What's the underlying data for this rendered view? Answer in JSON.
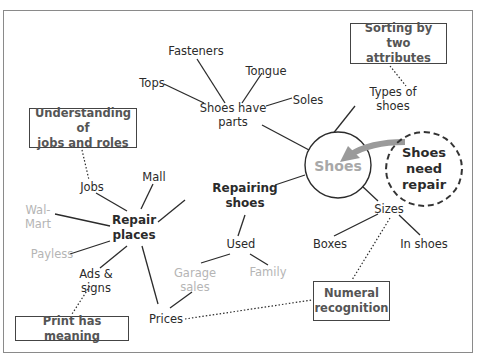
{
  "diagram": {
    "central_topic": "Shoes",
    "trigger": "Shoes\nneed\nrepair",
    "nodes": {
      "fasteners": "Fasteners",
      "tops": "Tops",
      "tongue": "Tongue",
      "soles": "Soles",
      "shoes_have_parts": "Shoes have\nparts",
      "types_of_shoes": "Types of\nshoes",
      "repairing_shoes": "Repairing\nshoes",
      "used": "Used",
      "garage_sales": "Garage\nsales",
      "family": "Family",
      "sizes": "Sizes",
      "boxes": "Boxes",
      "in_shoes": "In shoes",
      "repair_places": "Repair\nplaces",
      "mall": "Mall",
      "jobs": "Jobs",
      "walmart": "Wal-\nMart",
      "payless": "Payless",
      "ads_signs": "Ads &\nsigns",
      "prices": "Prices"
    },
    "concept_boxes": {
      "sorting": "Sorting by two\nattributes",
      "jobs_roles": "Understanding of\njobs and roles",
      "print": "Print has meaning",
      "numeral": "Numeral\nrecognition"
    },
    "colors": {
      "line": "#2b2b2b",
      "grey_text": "#b5b5b5",
      "arrow": "#9a9a9a",
      "frame": "#8a8a8a"
    }
  }
}
